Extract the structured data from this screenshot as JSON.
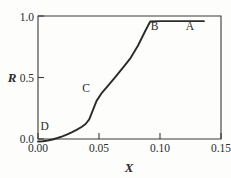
{
  "chart_data": {
    "type": "line",
    "title": "",
    "xlabel": "X",
    "ylabel": "R",
    "xlim": [
      0.0,
      0.15
    ],
    "ylim": [
      0.0,
      1.0
    ],
    "grid": false,
    "legend": "none",
    "xticks": [
      0.0,
      0.05,
      0.1,
      0.15
    ],
    "xticklabels": [
      "0.00",
      "0.05",
      "0.10",
      "0.15"
    ],
    "yticks": [
      0.0,
      0.5,
      1.0
    ],
    "yticklabels": [
      "0.0",
      "0.5",
      "1.0"
    ],
    "series": [
      {
        "name": "R vs X",
        "x": [
          0.0,
          0.004,
          0.008,
          0.012,
          0.016,
          0.02,
          0.024,
          0.028,
          0.032,
          0.036,
          0.039,
          0.042,
          0.045,
          0.048,
          0.052,
          0.058,
          0.064,
          0.07,
          0.076,
          0.082,
          0.088,
          0.092,
          0.1,
          0.11,
          0.12,
          0.13,
          0.136
        ],
        "y": [
          -0.02,
          -0.018,
          -0.012,
          -0.004,
          0.008,
          0.022,
          0.038,
          0.056,
          0.076,
          0.1,
          0.122,
          0.16,
          0.235,
          0.31,
          0.37,
          0.44,
          0.512,
          0.585,
          0.66,
          0.76,
          0.88,
          0.955,
          0.958,
          0.958,
          0.958,
          0.958,
          0.958
        ]
      }
    ],
    "annotations": [
      {
        "label": "A",
        "x": 0.1245,
        "y": 0.885
      },
      {
        "label": "B",
        "x": 0.0955,
        "y": 0.885
      },
      {
        "label": "C",
        "x": 0.0395,
        "y": 0.385
      },
      {
        "label": "D",
        "x": 0.0055,
        "y": 0.075
      }
    ]
  },
  "colors": {
    "curve": "#2b2b2b",
    "axis": "#3a3a3a",
    "background": "#fdfdfc",
    "text": "#2b2b2b"
  }
}
